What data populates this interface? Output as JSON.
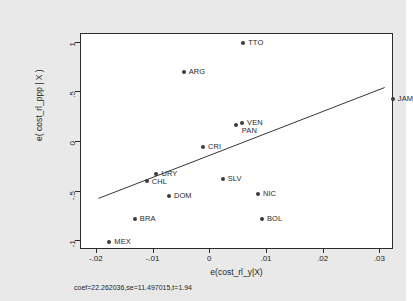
{
  "chart_data": {
    "type": "scatter",
    "title": "",
    "xlabel": "e(cost_rl_y|X)",
    "ylabel": "e( cost_rl_ppp | X )",
    "xlim": [
      -0.0228,
      0.0324
    ],
    "ylim": [
      -1.09,
      1.09
    ],
    "xticks": [
      "-.02",
      "-.01",
      "0",
      ".01",
      ".02",
      ".03"
    ],
    "xtick_values": [
      -0.02,
      -0.01,
      0,
      0.01,
      0.02,
      0.03
    ],
    "yticks": [
      "1",
      ".5",
      "0",
      "-.5",
      "-1"
    ],
    "ytick_values": [
      1,
      0.5,
      0,
      -0.5,
      -1
    ],
    "grid": false,
    "legend": "none",
    "annotation": "coef=22.262036,se=11.497015,t=1.94",
    "coef": 22.262036,
    "se": 11.497015,
    "t": 1.94,
    "fit_line": {
      "x_start": -0.0197,
      "y_start": -0.585,
      "x_end": 0.0311,
      "y_end": 0.545
    },
    "points": [
      {
        "label": "TTO",
        "x": 0.0058,
        "y": 1.0,
        "lx": 5,
        "ly": -4
      },
      {
        "label": "ARG",
        "x": -0.0047,
        "y": 0.705,
        "lx": 5,
        "ly": -4
      },
      {
        "label": "JAM",
        "x": 0.0322,
        "y": 0.43,
        "lx": 5,
        "ly": -4
      },
      {
        "label": "VEN",
        "x": 0.0056,
        "y": 0.195,
        "lx": 5,
        "ly": -4
      },
      {
        "label": "PAN",
        "x": 0.0045,
        "y": 0.175,
        "lx": 6,
        "ly": 2
      },
      {
        "label": "CRI",
        "x": -0.0013,
        "y": -0.055,
        "lx": 5,
        "ly": -4
      },
      {
        "label": "URY",
        "x": -0.0095,
        "y": -0.325,
        "lx": 5,
        "ly": -4
      },
      {
        "label": "CHL",
        "x": -0.0112,
        "y": -0.395,
        "lx": 5,
        "ly": -3
      },
      {
        "label": "SLV",
        "x": 0.0022,
        "y": -0.375,
        "lx": 5,
        "ly": -4
      },
      {
        "label": "DOM",
        "x": -0.0073,
        "y": -0.545,
        "lx": 5,
        "ly": -4
      },
      {
        "label": "NIC",
        "x": 0.0084,
        "y": -0.525,
        "lx": 5,
        "ly": -4
      },
      {
        "label": "BRA",
        "x": -0.0133,
        "y": -0.775,
        "lx": 5,
        "ly": -4
      },
      {
        "label": "BOL",
        "x": 0.0091,
        "y": -0.775,
        "lx": 5,
        "ly": -4
      },
      {
        "label": "MEX",
        "x": -0.0178,
        "y": -1.005,
        "lx": 5,
        "ly": -4
      }
    ]
  }
}
